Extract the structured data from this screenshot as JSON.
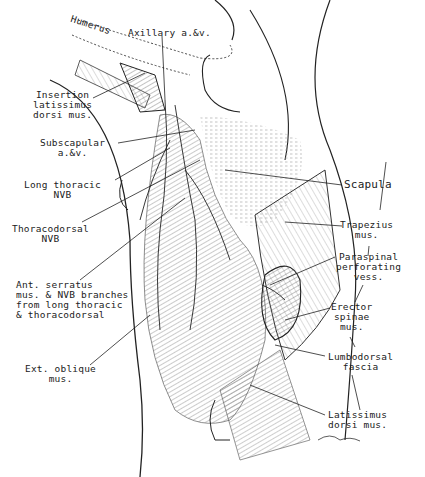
{
  "figure": {
    "type": "anatomical illustration",
    "labels": {
      "humerus": "Humerus",
      "axillary": "Axillary a.&v.",
      "insertion": "Insertion\nlatissimus\ndorsi mus.",
      "subscapular": "Subscapular\na.&v.",
      "long_thoracic": "Long thoracic\nNVB",
      "thoracodorsal": "Thoracodorsal\nNVB",
      "ant_serratus": "Ant. serratus\nmus. & NVB branches\nfrom long thoracic\n& thoracodorsal",
      "ext_oblique": "Ext. oblique\nmus.",
      "scapula": "Scapula",
      "trapezius": "Trapezius\nmus.",
      "paraspinal": "Paraspinal\nperforating\nvess.",
      "erector": "Erector\nspinae\nmus.",
      "lumbodorsal": "Lumbodorsal\nfascia",
      "latissimus": "Latissimus\ndorsi mus."
    },
    "colors": {
      "ink": "#222222",
      "background": "#ffffff",
      "hatch": "#555555"
    }
  }
}
